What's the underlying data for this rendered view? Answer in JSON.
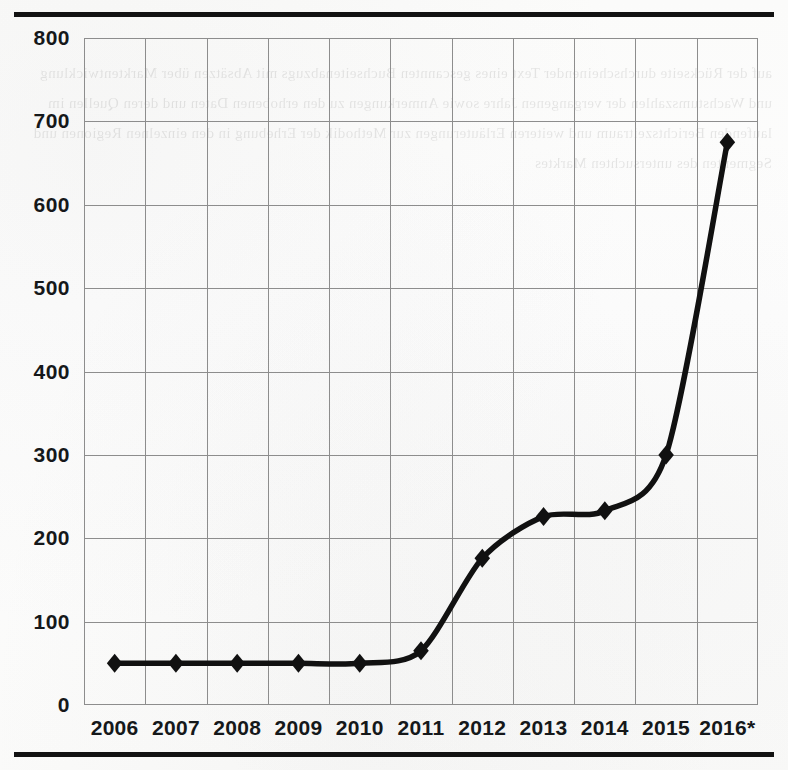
{
  "page": {
    "background_color": "#fdfdfc",
    "rule_color": "#121212",
    "bleed_text": "auf der Rückseite durchscheinender Text eines gescannten Buchseitenabzugs mit Absätzen über Marktentwicklung und Wachstumszahlen der vergangenen Jahre sowie Anmerkungen zu den erhobenen Daten und deren Quellen im laufenden Berichtszeitraum und weiteren Erläuterungen zur Methodik der Erhebung in den einzelnen Regionen und Segmenten des untersuchten Marktes"
  },
  "chart_data": {
    "type": "line",
    "title": "",
    "subtitle": "",
    "xlabel": "",
    "ylabel": "",
    "categories": [
      "2006",
      "2007",
      "2008",
      "2009",
      "2010",
      "2011",
      "2012",
      "2013",
      "2014",
      "2015",
      "2016*"
    ],
    "values": [
      50,
      50,
      50,
      50,
      50,
      65,
      176,
      226,
      233,
      300,
      675
    ],
    "series": [
      {
        "name": "",
        "values": [
          50,
          50,
          50,
          50,
          50,
          65,
          176,
          226,
          233,
          300,
          675
        ],
        "marker": "diamond",
        "line_color": "#111111",
        "marker_color": "#111111"
      }
    ],
    "ylim": [
      0,
      800
    ],
    "ytick_labels": [
      "0",
      "100",
      "200",
      "300",
      "400",
      "500",
      "600",
      "700",
      "800"
    ],
    "ytick_values": [
      0,
      100,
      200,
      300,
      400,
      500,
      600,
      700,
      800
    ],
    "grid": true,
    "grid_color": "#8d8d8d",
    "legend": false,
    "legend_position": "none",
    "annotations": [
      "* denotes a projected or preliminary value for 2016"
    ]
  }
}
